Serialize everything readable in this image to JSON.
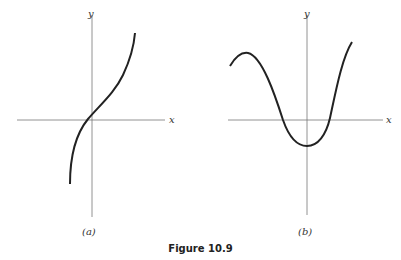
{
  "figure": {
    "caption": "Figure 10.9",
    "panels": [
      {
        "label": "(a)",
        "x_axis_label": "x",
        "y_axis_label": "y",
        "description": "increasing curve passing near origin with inflection"
      },
      {
        "label": "(b)",
        "x_axis_label": "x",
        "y_axis_label": "y",
        "description": "wave-like curve with local max on left, minimum below origin, rising on right"
      }
    ]
  },
  "colors": {
    "ink": "#222222",
    "axis": "#666666",
    "background": "#ffffff"
  }
}
